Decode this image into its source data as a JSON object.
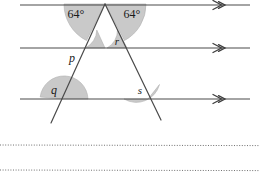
{
  "figure": {
    "background_color": "#ffffff",
    "line_color": "#4a4a4a",
    "shade_color": "#c9c9c9",
    "shade_stroke": "#8a8a8a",
    "text_color": "#1a1a1a",
    "parallel_lines": [
      {
        "name": "top-parallel-line",
        "y": 5,
        "x_start": 20,
        "x_end": 250,
        "marker": "single-arrow"
      },
      {
        "name": "middle-parallel-line",
        "y": 48,
        "x_start": 20,
        "x_end": 250,
        "marker": "single-arrow"
      },
      {
        "name": "bottom-parallel-line",
        "y": 99,
        "x_start": 20,
        "x_end": 250,
        "marker": "single-arrow"
      }
    ],
    "transversals": [
      {
        "name": "left-transversal",
        "x1": 105,
        "y1": 4,
        "x2": 51,
        "y2": 123
      },
      {
        "name": "right-transversal",
        "x1": 105,
        "y1": 4,
        "x2": 161,
        "y2": 120
      }
    ],
    "apex": {
      "x": 105,
      "y": 4
    },
    "angles": [
      {
        "name": "angle-64-left",
        "label": "64°",
        "cx": 76,
        "cy": 14,
        "type": "degree"
      },
      {
        "name": "angle-64-right",
        "label": "64°",
        "cx": 131,
        "cy": 14,
        "type": "degree"
      },
      {
        "name": "angle-p",
        "label": "p",
        "cx": 71,
        "cy": 58,
        "type": "variable"
      },
      {
        "name": "angle-r",
        "label": "r",
        "cx": 117,
        "cy": 41,
        "type": "variable"
      },
      {
        "name": "angle-q",
        "label": "q",
        "cx": 53,
        "cy": 90,
        "type": "variable"
      },
      {
        "name": "angle-s",
        "label": "s",
        "cx": 139,
        "cy": 90,
        "type": "variable"
      }
    ],
    "dotted_rules": [
      {
        "name": "dotted-rule-upper",
        "y": 145,
        "x_start": 0,
        "x_end": 260
      },
      {
        "name": "dotted-rule-lower",
        "y": 170,
        "x_start": 0,
        "x_end": 260
      }
    ]
  }
}
